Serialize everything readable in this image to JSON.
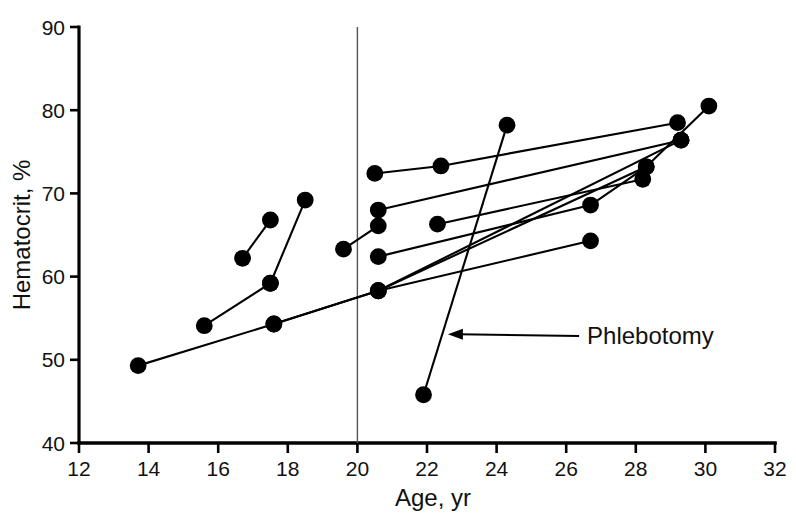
{
  "chart_data": {
    "type": "scatter",
    "title": "",
    "xlabel": "Age, yr",
    "ylabel": "Hematocrit, %",
    "xlim": [
      12,
      32
    ],
    "ylim": [
      40,
      90
    ],
    "xticks": [
      12,
      14,
      16,
      18,
      20,
      22,
      24,
      26,
      28,
      30,
      32
    ],
    "yticks": [
      40,
      50,
      60,
      70,
      80,
      90
    ],
    "xtick_labels": [
      "12",
      "14",
      "16",
      "18",
      "20",
      "22",
      "24",
      "26",
      "28",
      "30",
      "32"
    ],
    "ytick_labels": [
      "40",
      "50",
      "60",
      "70",
      "80",
      "90"
    ],
    "grid": false,
    "legend": null,
    "marker": "filled-circle",
    "marker_color": "#000000",
    "line_color": "#000000",
    "reference_lines": [
      {
        "name": "age-20-vertical",
        "orientation": "vertical",
        "x": 20.0,
        "color": "#555555"
      }
    ],
    "annotations": [
      {
        "text": "Phlebotomy",
        "x": 26.6,
        "y": 51.9,
        "arrow_to_x": 22.6,
        "arrow_to_y": 52.1,
        "points_to": "phlebotomy-series"
      }
    ],
    "series": [
      {
        "name": "patient-1",
        "points": [
          {
            "x": 16.7,
            "y": 62.2
          },
          {
            "x": 17.5,
            "y": 66.8
          }
        ]
      },
      {
        "name": "patient-2",
        "points": [
          {
            "x": 17.5,
            "y": 59.2
          },
          {
            "x": 18.5,
            "y": 69.2
          }
        ]
      },
      {
        "name": "patient-3",
        "points": [
          {
            "x": 15.6,
            "y": 54.1
          },
          {
            "x": 17.5,
            "y": 59.2
          }
        ]
      },
      {
        "name": "patient-4",
        "points": [
          {
            "x": 13.7,
            "y": 49.3
          },
          {
            "x": 17.6,
            "y": 54.3
          },
          {
            "x": 20.6,
            "y": 58.3
          },
          {
            "x": 28.3,
            "y": 73.2
          },
          {
            "x": 30.1,
            "y": 80.5
          }
        ]
      },
      {
        "name": "patient-5",
        "points": [
          {
            "x": 17.6,
            "y": 54.3
          },
          {
            "x": 20.6,
            "y": 58.3
          },
          {
            "x": 29.3,
            "y": 76.4
          }
        ]
      },
      {
        "name": "patient-6",
        "points": [
          {
            "x": 19.6,
            "y": 63.3
          },
          {
            "x": 20.6,
            "y": 66.1
          }
        ]
      },
      {
        "name": "patient-7",
        "points": [
          {
            "x": 20.5,
            "y": 72.4
          },
          {
            "x": 22.4,
            "y": 73.3
          },
          {
            "x": 29.2,
            "y": 78.5
          }
        ]
      },
      {
        "name": "patient-8",
        "points": [
          {
            "x": 20.6,
            "y": 68.0
          },
          {
            "x": 29.3,
            "y": 76.4
          }
        ]
      },
      {
        "name": "patient-9",
        "points": [
          {
            "x": 20.6,
            "y": 62.4
          },
          {
            "x": 26.7,
            "y": 68.6
          },
          {
            "x": 28.3,
            "y": 73.2
          }
        ]
      },
      {
        "name": "patient-10",
        "points": [
          {
            "x": 22.3,
            "y": 66.3
          },
          {
            "x": 28.2,
            "y": 71.7
          }
        ]
      },
      {
        "name": "patient-11",
        "points": [
          {
            "x": 20.6,
            "y": 58.3
          },
          {
            "x": 26.7,
            "y": 64.3
          }
        ]
      },
      {
        "name": "phlebotomy-series",
        "points": [
          {
            "x": 21.9,
            "y": 45.8
          },
          {
            "x": 24.3,
            "y": 78.2
          }
        ]
      }
    ]
  }
}
